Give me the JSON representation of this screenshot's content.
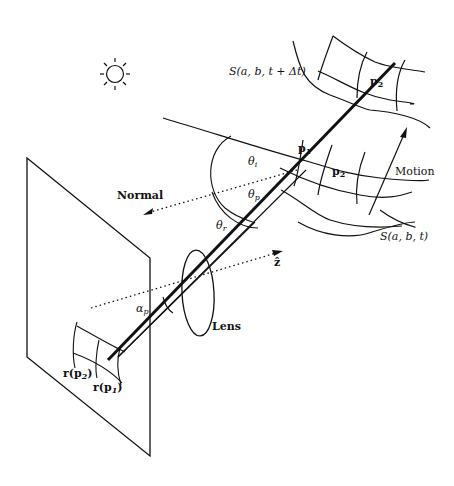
{
  "figure": {
    "labels": {
      "surface_next": "S(a, b, t + Δt)",
      "surface_now": "S(a, b, t)",
      "p1": "p",
      "p1_sub": "1",
      "p2_top": "p",
      "p2_top_sub": "2",
      "p2_mid": "p",
      "p2_mid_sub": "2",
      "motion": "Motion",
      "normal": "Normal",
      "theta_i": "θ",
      "theta_i_sub": "i",
      "theta_p": "θ",
      "theta_p_sub": "p",
      "theta_r": "θ",
      "theta_r_sub": "r",
      "z_hat": "ẑ",
      "alpha_p": "α",
      "alpha_p_sub": "p",
      "lens": "Lens",
      "r_p2": "r(p",
      "r_p2_sub": "2",
      "r_p1": "r(p",
      "r_p1_sub": "1",
      "close_paren": ")"
    },
    "icons": {
      "light_source": "sun-icon"
    },
    "colors": {
      "ink": "#111111",
      "background": "#ffffff"
    }
  }
}
